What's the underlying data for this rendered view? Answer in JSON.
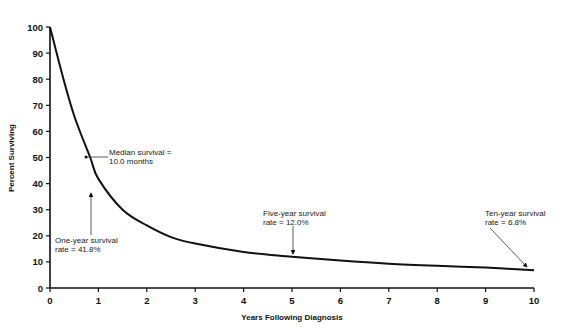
{
  "chart_data": {
    "type": "line",
    "title": "",
    "xlabel": "Years Following Diagnosis",
    "ylabel": "Percent Surviving",
    "xlim": [
      0,
      10
    ],
    "ylim": [
      0,
      100
    ],
    "x_ticks": [
      0,
      1,
      2,
      3,
      4,
      5,
      6,
      7,
      8,
      9,
      10
    ],
    "y_ticks": [
      0,
      10,
      20,
      30,
      40,
      50,
      60,
      70,
      80,
      90,
      100
    ],
    "grid": false,
    "legend": null,
    "series": [
      {
        "name": "Survival",
        "x": [
          0,
          0.25,
          0.5,
          0.83,
          1.0,
          1.5,
          2.0,
          2.5,
          3.0,
          4.0,
          5.0,
          6.0,
          7.0,
          8.0,
          9.0,
          10.0
        ],
        "y": [
          100,
          82,
          66,
          50,
          41.8,
          30,
          24,
          19.5,
          17,
          13.8,
          12.0,
          10.5,
          9.3,
          8.5,
          7.8,
          6.8
        ]
      }
    ],
    "annotations": [
      {
        "text": "Median survival = 10.0  months",
        "x": 0.83,
        "y": 50
      },
      {
        "text": "One-year survival rate = 41.8%",
        "x": 1.0,
        "y": 41.8
      },
      {
        "text": "Five-year survival rate = 12.0%",
        "x": 5.0,
        "y": 12.0
      },
      {
        "text": "Ten-year survival rate = 6.8%",
        "x": 9.9,
        "y": 6.8
      }
    ]
  },
  "labels": {
    "xlabel": "Years Following Diagnosis",
    "ylabel": "Percent Surviving",
    "median_line1": "Median survival =",
    "median_line2": "10.0  months",
    "one_year_line1": "One-year survival",
    "one_year_line2": "rate = 41.8%",
    "five_year_line1": "Five-year survival",
    "five_year_line2": "rate = 12.0%",
    "ten_year_line1": "Ten-year survival",
    "ten_year_line2": "rate = 6.8%"
  },
  "colors": {
    "line": "#111111",
    "axis": "#111111",
    "annotation_arrow": "#333333"
  }
}
